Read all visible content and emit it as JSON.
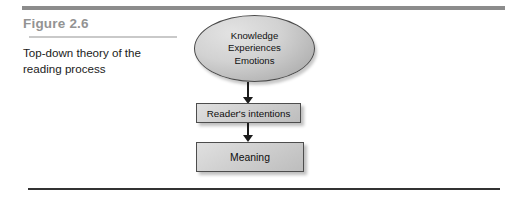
{
  "figure": {
    "number_label": "Figure 2.6",
    "caption": "Top-down theory of the reading process"
  },
  "diagram": {
    "type": "flowchart",
    "direction": "top-down",
    "nodes": [
      {
        "id": "sources",
        "shape": "ellipse",
        "lines": [
          "Knowledge",
          "Experiences",
          "Emotions"
        ]
      },
      {
        "id": "intentions",
        "shape": "rectangle",
        "label": "Reader's intentions"
      },
      {
        "id": "meaning",
        "shape": "rectangle",
        "label": "Meaning"
      }
    ],
    "connectors": [
      {
        "from": "sources",
        "to": "intentions",
        "style": "arrow-down"
      },
      {
        "from": "intentions",
        "to": "meaning",
        "style": "arrow-down"
      }
    ]
  },
  "colors": {
    "top_rule": "#8c8c8c",
    "figure_number": "#939393",
    "title_underline": "#c9c9c9",
    "caption_text": "#1b1b1b",
    "node_fill": "#d0d0d0",
    "node_border": "#4d4d4d",
    "connector": "#1c1c1c",
    "bottom_rule": "#333333"
  }
}
